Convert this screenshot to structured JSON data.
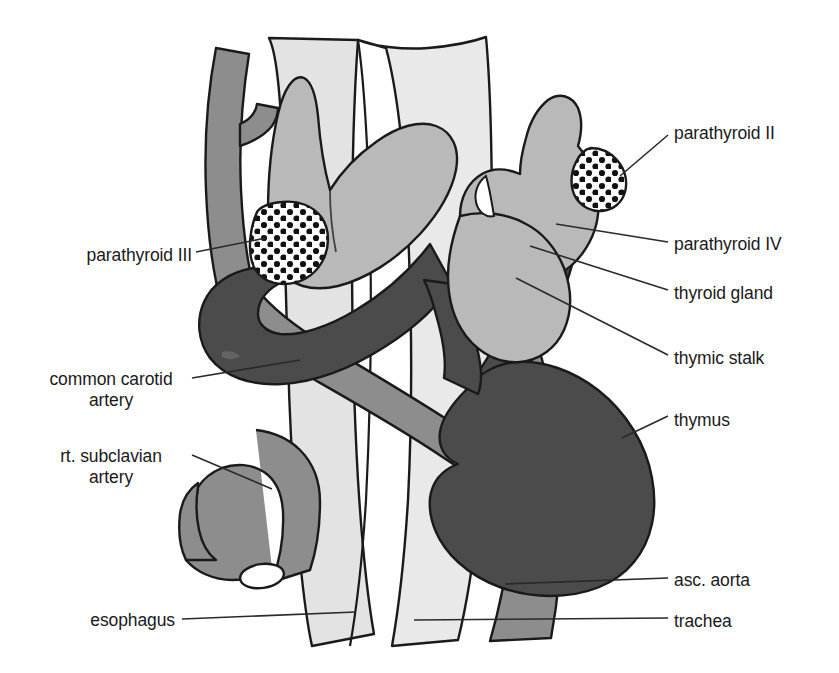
{
  "figure": {
    "type": "anatomical-diagram",
    "background_color": "#ffffff"
  },
  "palette": {
    "outline": "#1a1a1a",
    "trachea_fill": "#e9e9e9",
    "esophagus_fill": "#e3e3e3",
    "thyroid_fill": "#b9b9b9",
    "artery_fill": "#8d8d8d",
    "aorta_fill": "#8d8d8d",
    "thymus_fill": "#4b4b4b",
    "parathyroid_fill": "#ffffff",
    "parathyroid_dot": "#111111",
    "leader_line": "#2a2a2a",
    "label_text": "#1a1a1a"
  },
  "labels": [
    {
      "id": "parathyroid-ii",
      "text": "parathyroid II",
      "side": "right",
      "x": 674,
      "y": 123,
      "leader": {
        "x1": 641,
        "y1": 166,
        "x2": 617,
        "y2": 179
      }
    },
    {
      "id": "parathyroid-iv",
      "text": "parathyroid IV",
      "side": "right",
      "x": 674,
      "y": 234,
      "leader": {
        "x1": 667,
        "y1": 243,
        "x2": 556,
        "y2": 224
      }
    },
    {
      "id": "thyroid-gland",
      "text": "thyroid gland",
      "side": "right",
      "x": 674,
      "y": 283,
      "leader": {
        "x1": 667,
        "y1": 291,
        "x2": 530,
        "y2": 246
      }
    },
    {
      "id": "thymic-stalk",
      "text": "thymic stalk",
      "side": "right",
      "x": 674,
      "y": 348,
      "leader": {
        "x1": 667,
        "y1": 356,
        "x2": 517,
        "y2": 277
      }
    },
    {
      "id": "thymus",
      "text": "thymus",
      "side": "right",
      "x": 674,
      "y": 410,
      "leader": {
        "x1": 667,
        "y1": 418,
        "x2": 622,
        "y2": 437
      }
    },
    {
      "id": "asc-aorta",
      "text": "asc. aorta",
      "side": "right",
      "x": 674,
      "y": 570,
      "leader": {
        "x1": 667,
        "y1": 578,
        "x2": 505,
        "y2": 585
      }
    },
    {
      "id": "trachea",
      "text": "trachea",
      "side": "right",
      "x": 674,
      "y": 611,
      "leader": {
        "x1": 667,
        "y1": 619,
        "x2": 415,
        "y2": 619
      }
    },
    {
      "id": "parathyroid-iii",
      "text": "parathyroid III",
      "side": "left",
      "x": 192,
      "y": 245,
      "leader": {
        "x1": 196,
        "y1": 253,
        "x2": 262,
        "y2": 240
      }
    },
    {
      "id": "common-carotid-artery",
      "text": "common carotid\nartery",
      "side": "left",
      "x": 186,
      "y": 369,
      "leader": {
        "x1": 190,
        "y1": 378,
        "x2": 297,
        "y2": 362
      }
    },
    {
      "id": "rt-subclavian-artery",
      "text": "rt. subclavian\nartery",
      "side": "left",
      "x": 186,
      "y": 446,
      "leader": {
        "x1": 190,
        "y1": 455,
        "x2": 272,
        "y2": 488
      }
    },
    {
      "id": "esophagus",
      "text": "esophagus",
      "side": "left",
      "x": 175,
      "y": 610,
      "leader": {
        "x1": 179,
        "y1": 619,
        "x2": 352,
        "y2": 613
      }
    }
  ],
  "structures": [
    {
      "id": "trachea",
      "name": "trachea",
      "fill": "#e9e9e9"
    },
    {
      "id": "esophagus",
      "name": "esophagus",
      "fill": "#e3e3e3"
    },
    {
      "id": "thyroid-gland",
      "name": "thyroid gland",
      "fill": "#b9b9b9"
    },
    {
      "id": "thymus",
      "name": "thymus",
      "fill": "#4b4b4b"
    },
    {
      "id": "thymic-stalk",
      "name": "thymic stalk",
      "fill": "#4b4b4b"
    },
    {
      "id": "common-carotid-artery",
      "name": "common carotid artery",
      "fill": "#8d8d8d"
    },
    {
      "id": "rt-subclavian-artery",
      "name": "rt. subclavian artery",
      "fill": "#8d8d8d"
    },
    {
      "id": "asc-aorta",
      "name": "asc. aorta",
      "fill": "#8d8d8d"
    },
    {
      "id": "parathyroid-ii",
      "name": "parathyroid II",
      "fill": "#ffffff"
    },
    {
      "id": "parathyroid-iii",
      "name": "parathyroid III",
      "fill": "#ffffff"
    },
    {
      "id": "parathyroid-iv",
      "name": "parathyroid IV",
      "fill": "#b9b9b9"
    }
  ]
}
